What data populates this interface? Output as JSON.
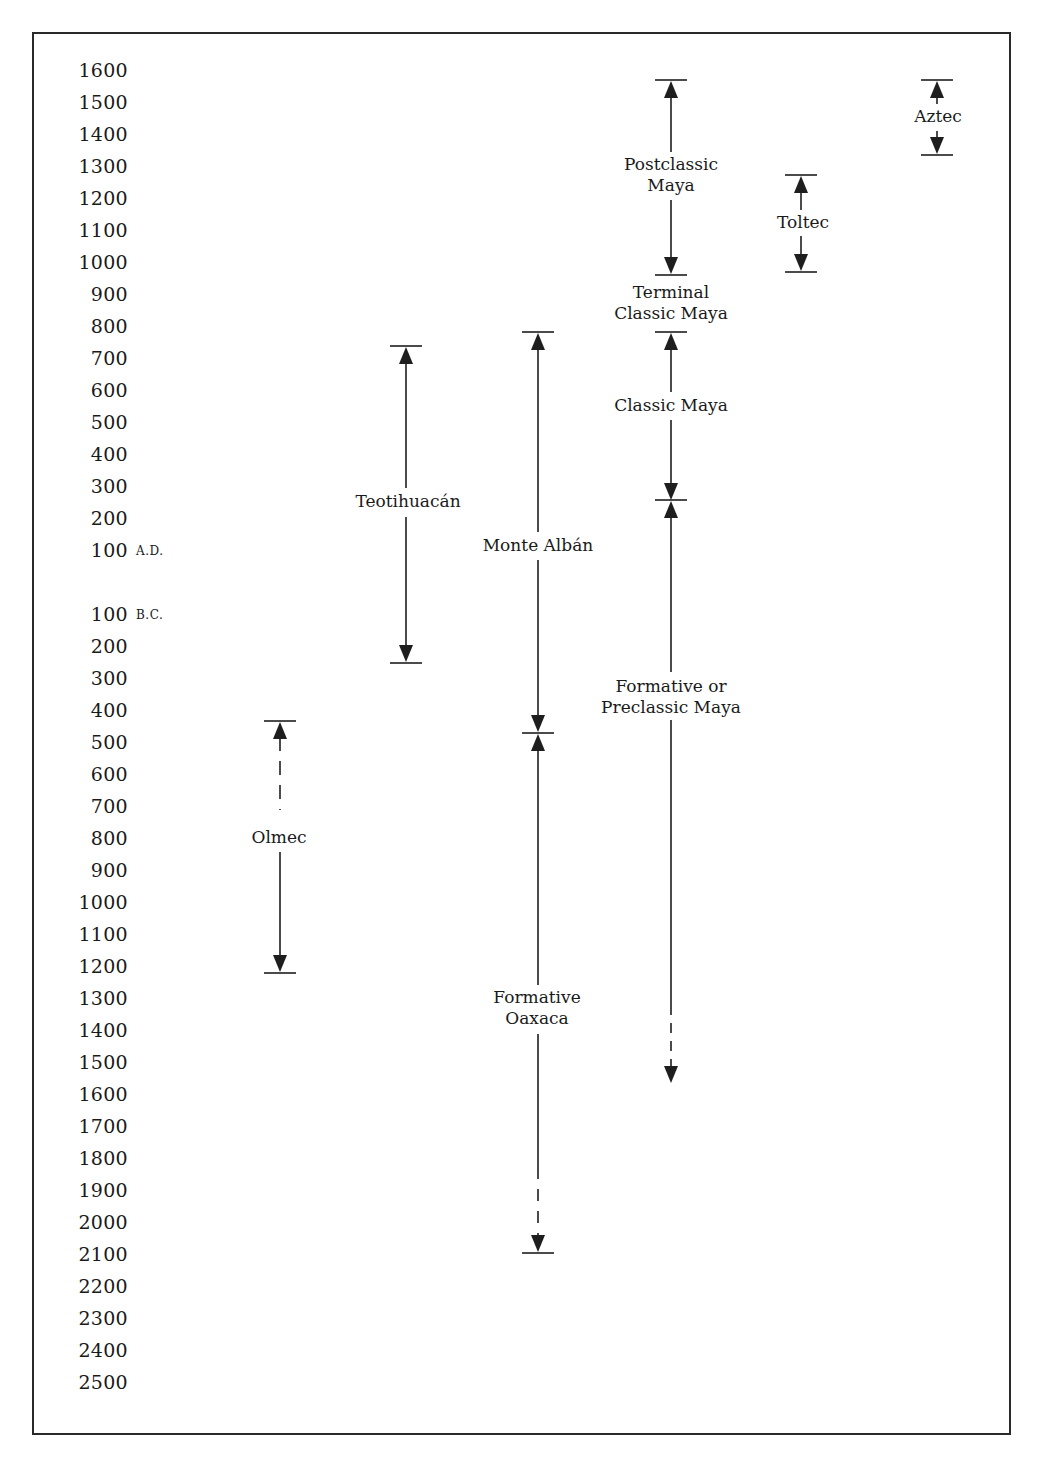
{
  "chart_data": {
    "type": "timeline",
    "title": "",
    "orientation": "vertical",
    "axis": {
      "labels_ad": [
        "1600",
        "1500",
        "1400",
        "1300",
        "1200",
        "1100",
        "1000",
        "900",
        "800",
        "700",
        "600",
        "500",
        "400",
        "300",
        "200",
        "100"
      ],
      "ad_suffix": "A.D.",
      "labels_bc": [
        "100",
        "200",
        "300",
        "400",
        "500",
        "600",
        "700",
        "800",
        "900",
        "1000",
        "1100",
        "1200",
        "1300",
        "1400",
        "1500",
        "1600",
        "1700",
        "1800",
        "1900",
        "2000",
        "2100",
        "2200",
        "2300",
        "2400",
        "2500"
      ],
      "bc_suffix": "B.C.",
      "range": [
        "1600 A.D.",
        "2500 B.C."
      ],
      "grid": false
    },
    "series": [
      {
        "name": "Olmec",
        "lines": [
          "Olmec"
        ],
        "x": 280,
        "start": -1220,
        "end": -430,
        "start_open": false,
        "end_dashed": true,
        "dashed_segment": "top"
      },
      {
        "name": "Teotihuacán",
        "lines": [
          "Teotihuacán"
        ],
        "x": 406,
        "start": -250,
        "end": 740
      },
      {
        "name": "Monte Albán",
        "lines": [
          "Monte Albán"
        ],
        "x": 538,
        "start": -470,
        "end": 785
      },
      {
        "name": "Formative Oaxaca",
        "lines": [
          "Formative",
          "Oaxaca"
        ],
        "x": 538,
        "start": -2100,
        "end": -470,
        "dashed_segment": "bottom"
      },
      {
        "name": "Formative or Preclassic Maya",
        "lines": [
          "Formative or",
          "Preclassic Maya"
        ],
        "x": 671,
        "start": -1550,
        "end": 250,
        "dashed_segment": "bottom",
        "open_bottom": true
      },
      {
        "name": "Classic Maya",
        "lines": [
          "Classic Maya"
        ],
        "x": 671,
        "start": 250,
        "end": 785
      },
      {
        "name": "Terminal Classic Maya",
        "lines": [
          "Terminal",
          "Classic Maya"
        ],
        "x": 671,
        "start": 785,
        "end": 955,
        "no_line": true
      },
      {
        "name": "Postclassic Maya",
        "lines": [
          "Postclassic",
          "Maya"
        ],
        "x": 671,
        "start": 955,
        "end": 1575
      },
      {
        "name": "Toltec",
        "lines": [
          "Toltec"
        ],
        "x": 801,
        "start": 970,
        "end": 1275
      },
      {
        "name": "Aztec",
        "lines": [
          "Aztec"
        ],
        "x": 937,
        "start": 1340,
        "end": 1575
      }
    ]
  },
  "labels": {
    "olmec": [
      "Olmec"
    ],
    "teotihuacan": [
      "Teotihuacán"
    ],
    "monte_alban": [
      "Monte Albán"
    ],
    "formative_oaxaca": [
      "Formative",
      "Oaxaca"
    ],
    "preclassic_maya": [
      "Formative or",
      "Preclassic Maya"
    ],
    "classic_maya": [
      "Classic Maya"
    ],
    "terminal_classic_maya": [
      "Terminal",
      "Classic Maya"
    ],
    "postclassic_maya": [
      "Postclassic",
      "Maya"
    ],
    "toltec": [
      "Toltec"
    ],
    "aztec": [
      "Aztec"
    ]
  }
}
